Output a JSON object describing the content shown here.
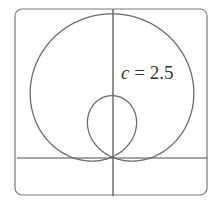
{
  "diagram": {
    "type": "polar-curve",
    "equation_family": "limacon r = 1 + c·sin(theta)",
    "label_var": "c",
    "label_eq": " = 2.5",
    "c": 2.5,
    "frame": {
      "x": 15,
      "y": 9,
      "w": 192,
      "h": 186,
      "radius": 7
    },
    "origin": {
      "x": 112,
      "y": 157
    },
    "scale": 40.9,
    "colors": {
      "curve": "#6a6a6a",
      "axes": "#4a4a4a",
      "frame": "#7a7a7a"
    }
  }
}
